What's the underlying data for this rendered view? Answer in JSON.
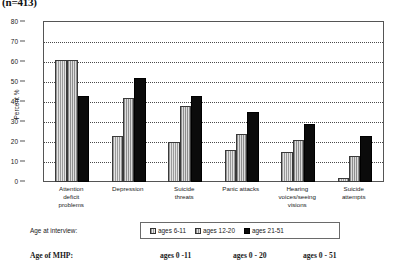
{
  "figure": {
    "title": "(n=413)"
  },
  "chart_data": {
    "type": "bar",
    "title": "(n=413)",
    "xlabel": "",
    "ylabel": "Percent %",
    "ylim": [
      0,
      80
    ],
    "ytick_step": 10,
    "yticks": [
      0,
      10,
      20,
      30,
      40,
      50,
      60,
      70,
      80
    ],
    "grid": true,
    "legend_position": "bottom",
    "categories": [
      "Attention deficit problems",
      "Depression",
      "Suicide threats",
      "Panic attacks",
      "Hearing voices/seeing visions",
      "Suicide attempts"
    ],
    "series": [
      {
        "name": "ages 6-11",
        "values": [
          61,
          23,
          20,
          16,
          15,
          2
        ]
      },
      {
        "name": "ages 12-20",
        "values": [
          61,
          42,
          38,
          24,
          21,
          13
        ]
      },
      {
        "name": "ages 21-51",
        "values": [
          43,
          52,
          43,
          35,
          29,
          23
        ]
      }
    ]
  },
  "category_labels": [
    [
      "Attention",
      "deficit",
      "problems"
    ],
    [
      "Depression"
    ],
    [
      "Suicide",
      "threats"
    ],
    [
      "Panic attacks"
    ],
    [
      "Hearing",
      "voices/seeing",
      "visions"
    ],
    [
      "Suicide",
      "attempts"
    ]
  ],
  "axis": {
    "y_title": "Percent %",
    "y_labels": [
      "80",
      "70",
      "60",
      "50",
      "40",
      "30",
      "20",
      "10",
      "0"
    ]
  },
  "legend": {
    "caption": "Age at interview:",
    "items": [
      {
        "label": "ages 6-11"
      },
      {
        "label": "ages 12-20"
      },
      {
        "label": "ages 21-51"
      }
    ]
  },
  "footnote": {
    "caption": "Age of MHP:",
    "values": [
      "ages  0 -11",
      "ages   0 - 20",
      "ages  0 - 51"
    ]
  }
}
